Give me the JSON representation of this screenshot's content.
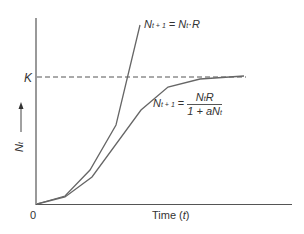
{
  "chart_data": {
    "type": "line",
    "title": "",
    "xlabel": "Time (t)",
    "ylabel": "N_t",
    "origin_label": "0",
    "k_label": "K",
    "grid": false,
    "legend": "inline annotations",
    "series": [
      {
        "name": "N_{t+1} = N_t · R",
        "kind": "exponential (unbounded)",
        "points_px": [
          [
            37,
            204
          ],
          [
            65,
            196
          ],
          [
            90,
            170
          ],
          [
            116,
            125
          ],
          [
            140,
            25
          ]
        ]
      },
      {
        "name": "N_{t+1} = N_t R / (1 + a N_t)",
        "kind": "logistic (saturates at K)",
        "points_px": [
          [
            37,
            204
          ],
          [
            65,
            197
          ],
          [
            92,
            177
          ],
          [
            141,
            110
          ],
          [
            168,
            87
          ],
          [
            200,
            79
          ],
          [
            244,
            76
          ]
        ]
      }
    ],
    "reference_lines": [
      {
        "label": "K",
        "style": "dashed",
        "y_px": 77
      }
    ],
    "colors": {
      "axis": "#555555",
      "curves": "#666666",
      "text": "#333333"
    }
  },
  "labels": {
    "k": "K",
    "origin": "0",
    "x_axis": "Time (",
    "x_axis_var": "t",
    "x_axis_close": ")",
    "y_axis_var": "N",
    "y_axis_sub": "t",
    "eq1_lhs": "N",
    "eq1_lhs_sub": "t + 1",
    "eq1_rhs": " = N",
    "eq1_rhs_sub": "t",
    "eq1_rhs_tail": "·R",
    "eq2_lhs": "N",
    "eq2_lhs_sub": "t + 1",
    "eq2_eq": " =",
    "eq2_num": "N",
    "eq2_num_sub": "t",
    "eq2_num_tail": "R",
    "eq2_den": "1 + aN",
    "eq2_den_sub": "t"
  }
}
